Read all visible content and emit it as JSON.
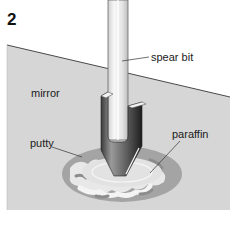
{
  "figure": {
    "step_number": "2",
    "labels": {
      "spear_bit": "spear bit",
      "mirror": "mirror",
      "putty": "putty",
      "paraffin": "paraffin"
    },
    "colors": {
      "mirror": "#d6d6d6",
      "mirror_edge": "#4a4a4a",
      "shaft": "#ececec",
      "shaft_edge": "#6a6a6a",
      "bit_dark": "#2e2e2e",
      "bit_mid": "#8a8a8a",
      "putty_light": "#f2f2f2",
      "putty_dark": "#9a9a9a",
      "paraffin": "#e4e4e4",
      "leader": "#333333"
    }
  }
}
